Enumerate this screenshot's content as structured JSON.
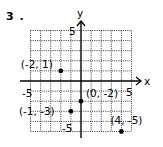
{
  "problem_number": "3 .",
  "axes": {
    "x_label": "x",
    "y_label": "y",
    "x_range": [
      -5,
      5
    ],
    "y_range": [
      -5,
      5
    ],
    "ticks": {
      "x_neg": "-5",
      "x_pos": "5",
      "y_pos": "5",
      "y_neg": "-5"
    }
  },
  "points": [
    {
      "x": -2,
      "y": 1,
      "label": "(-2, 1)"
    },
    {
      "x": 0,
      "y": -2,
      "label": "(0, -2)"
    },
    {
      "x": -1,
      "y": -3,
      "label": "(-1, -3)"
    },
    {
      "x": 4,
      "y": -5,
      "label": "(4, -5)"
    }
  ],
  "style": {
    "ink": "#000000",
    "background": "#ffffff"
  }
}
